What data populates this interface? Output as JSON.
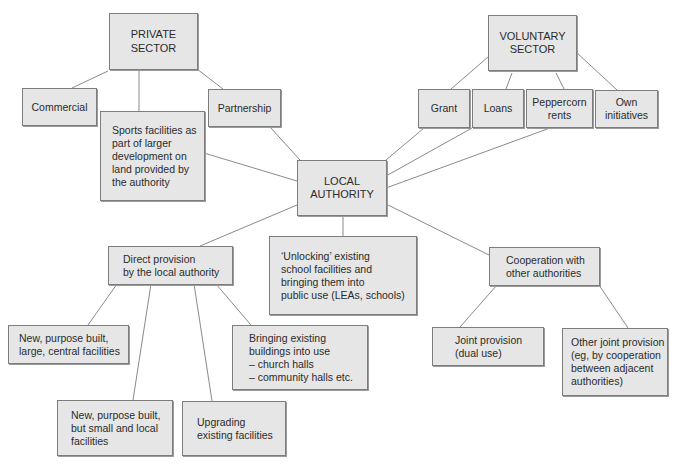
{
  "diagram": {
    "nodes": {
      "private_sector": "PRIVATE\nSECTOR",
      "commercial": "Commercial",
      "sports_facilities": "Sports facilities as\npart of larger\ndevelopment on\nland provided by\nthe authority",
      "partnership": "Partnership",
      "local_authority": "LOCAL\nAUTHORITY",
      "voluntary_sector": "VOLUNTARY\nSECTOR",
      "grant": "Grant",
      "loans": "Loans",
      "peppercorn_rents": "Peppercorn\nrents",
      "own_initiatives": "Own\ninitiatives",
      "direct_provision": "Direct provision\nby the local authority",
      "unlocking": "‘Unlocking’ existing\nschool facilities and\nbringing them into\npublic use (LEAs, schools)",
      "cooperation": "Cooperation with\nother authorities",
      "new_large": "New, purpose built,\nlarge, central facilities",
      "bringing_existing": "Bringing existing\nbuildings into use\n– church halls\n– community halls etc.",
      "new_small": "New, purpose built,\nbut small and local\nfacilities",
      "upgrading": "Upgrading\nexisting facilities",
      "joint_provision": "Joint provision\n(dual use)",
      "other_joint": "Other joint provision\n(eg, by cooperation\nbetween adjacent\nauthorities)"
    },
    "edges": [
      [
        "private_sector",
        "commercial"
      ],
      [
        "private_sector",
        "sports_facilities"
      ],
      [
        "private_sector",
        "partnership"
      ],
      [
        "partnership",
        "local_authority"
      ],
      [
        "sports_facilities",
        "local_authority"
      ],
      [
        "voluntary_sector",
        "grant"
      ],
      [
        "voluntary_sector",
        "loans"
      ],
      [
        "voluntary_sector",
        "peppercorn_rents"
      ],
      [
        "voluntary_sector",
        "own_initiatives"
      ],
      [
        "grant",
        "local_authority"
      ],
      [
        "loans",
        "local_authority"
      ],
      [
        "peppercorn_rents",
        "local_authority"
      ],
      [
        "local_authority",
        "direct_provision"
      ],
      [
        "local_authority",
        "unlocking"
      ],
      [
        "local_authority",
        "cooperation"
      ],
      [
        "direct_provision",
        "new_large"
      ],
      [
        "direct_provision",
        "new_small"
      ],
      [
        "direct_provision",
        "upgrading"
      ],
      [
        "direct_provision",
        "bringing_existing"
      ],
      [
        "cooperation",
        "joint_provision"
      ],
      [
        "cooperation",
        "other_joint"
      ]
    ]
  },
  "colors": {
    "box_fill": "#e6e6e6",
    "box_border": "#7d7d7d",
    "line": "#8a8a8a",
    "text": "#2b2b2b"
  }
}
